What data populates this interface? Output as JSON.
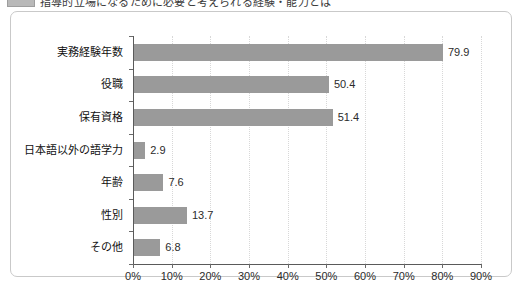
{
  "caption": {
    "badge": "chart-number-badge",
    "text": "指導的立場になるために必要と考えられる経験・能力とは",
    "cut_off": true
  },
  "chart_data": {
    "type": "bar",
    "orientation": "horizontal",
    "title": "",
    "subtitle": "",
    "xlabel": "",
    "ylabel": "",
    "categories": [
      "実務経験年数",
      "役職",
      "保有資格",
      "日本語以外の語学力",
      "年齢",
      "性別",
      "その他"
    ],
    "values": [
      79.9,
      50.4,
      51.4,
      2.9,
      7.6,
      13.7,
      6.8
    ],
    "value_labels": [
      "79.9",
      "50.4",
      "51.4",
      "2.9",
      "7.6",
      "13.7",
      "6.8"
    ],
    "xlim": [
      0,
      90
    ],
    "xticks": [
      0,
      10,
      20,
      30,
      40,
      50,
      60,
      70,
      80,
      90
    ],
    "xtick_labels": [
      "0%",
      "10%",
      "20%",
      "30%",
      "40%",
      "50%",
      "60%",
      "70%",
      "80%",
      "90%"
    ],
    "grid": true,
    "grid_axis": "x",
    "legend": false,
    "series_color": "#9a9a9a",
    "axis_color": "#5a5a5a",
    "gridline_color": "#d8d8d8",
    "text_color": "#111111",
    "background": "#ffffff",
    "frame_border_color": "#c9c9c9"
  }
}
